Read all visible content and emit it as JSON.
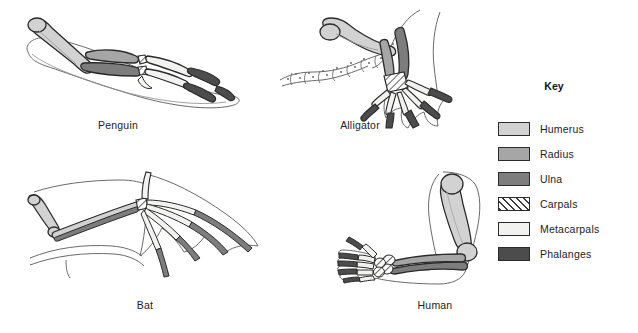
{
  "figures": [
    {
      "id": "penguin",
      "label": "Penguin"
    },
    {
      "id": "alligator",
      "label": "Alligator"
    },
    {
      "id": "bat",
      "label": "Bat"
    },
    {
      "id": "human",
      "label": "Human"
    }
  ],
  "key": {
    "title": "Key",
    "items": [
      {
        "label": "Humerus",
        "color": "#d2d2d2",
        "pattern": "solid"
      },
      {
        "label": "Radius",
        "color": "#a6a6a6",
        "pattern": "solid"
      },
      {
        "label": "Ulna",
        "color": "#7d7d7d",
        "pattern": "solid"
      },
      {
        "label": "Carpals",
        "color": "#ffffff",
        "pattern": "hatch"
      },
      {
        "label": "Metacarpals",
        "color": "#f2f2f0",
        "pattern": "stipple"
      },
      {
        "label": "Phalanges",
        "color": "#4c4c4c",
        "pattern": "solid"
      }
    ]
  },
  "colors": {
    "outline": "#2b2b2b",
    "body_outline": "#555555",
    "background": "#ffffff"
  }
}
